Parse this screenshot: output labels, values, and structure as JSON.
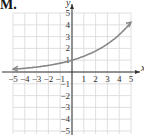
{
  "problem_label": "M.",
  "chart_data": {
    "type": "line",
    "title": "",
    "xlabel": "x",
    "ylabel": "y",
    "xlim": [
      -5,
      5
    ],
    "ylim": [
      -5,
      5
    ],
    "grid": true,
    "xticks": [
      "−5",
      "−4",
      "−3",
      "−2",
      "−1",
      "1",
      "2",
      "3",
      "4",
      "5"
    ],
    "xtick_values": [
      -5,
      -4,
      -3,
      -2,
      -1,
      1,
      2,
      3,
      4,
      5
    ],
    "yticks": [
      "5",
      "4",
      "3",
      "2",
      "1",
      "−1",
      "−2",
      "−3",
      "−4",
      "−5"
    ],
    "ytick_values": [
      5,
      4,
      3,
      2,
      1,
      -1,
      -2,
      -3,
      -4,
      -5
    ],
    "series": [
      {
        "name": "y = (4/3)^x",
        "x": [
          -5,
          -4,
          -3,
          -2,
          -1,
          0,
          1,
          2,
          3,
          4,
          5
        ],
        "y": [
          0.24,
          0.32,
          0.42,
          0.56,
          0.75,
          1,
          1.33,
          1.78,
          2.37,
          3.16,
          4.21
        ],
        "arrows": "both",
        "color": "#888888"
      }
    ]
  }
}
